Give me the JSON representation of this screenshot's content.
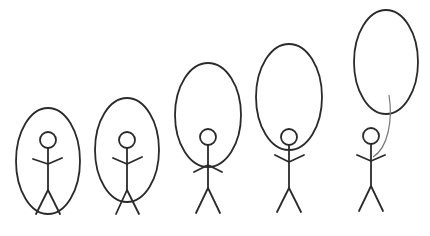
{
  "diagram": {
    "title": "",
    "stroke_color": "#2a2a2a",
    "background": "#ffffff",
    "figures": [
      {
        "id": 1,
        "cx": 48,
        "head_y": 140,
        "oval": {
          "cx": 48,
          "cy": 161,
          "rx": 32,
          "ry": 53
        }
      },
      {
        "id": 2,
        "cx": 127,
        "head_y": 140,
        "oval": {
          "cx": 127,
          "cy": 150,
          "rx": 32,
          "ry": 52
        }
      },
      {
        "id": 3,
        "cx": 208,
        "head_y": 137,
        "oval": {
          "cx": 208,
          "cy": 115,
          "rx": 33,
          "ry": 52
        }
      },
      {
        "id": 4,
        "cx": 289,
        "head_y": 137,
        "oval": {
          "cx": 289,
          "cy": 97,
          "rx": 33,
          "ry": 53
        }
      },
      {
        "id": 5,
        "cx": 370,
        "head_y": 135,
        "oval": {
          "cx": 386,
          "cy": 62,
          "rx": 32,
          "ry": 52
        },
        "string": true
      }
    ]
  }
}
